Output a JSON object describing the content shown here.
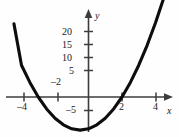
{
  "figure": {
    "kind": "cartesian-graph",
    "background_color": "#fefefe",
    "curve_color": "#0d0d0d",
    "axis_color": "#3c3c3c",
    "label_color": "#1a1a1a"
  },
  "chart_data": {
    "type": "line",
    "title": "",
    "subtitle": "",
    "xlabel": "x",
    "ylabel": "y",
    "grid": false,
    "legend": null,
    "xlim": [
      -4.7,
      5.3
    ],
    "ylim": [
      -9.5,
      24.5
    ],
    "x_ticks": [
      -4,
      -2,
      2,
      4
    ],
    "x_tick_labels": [
      "–4",
      "–2",
      "2",
      "4"
    ],
    "y_ticks": [
      -5,
      5,
      10,
      15,
      20
    ],
    "y_tick_labels": [
      "–5",
      "5",
      "10",
      "15",
      "20"
    ],
    "series": [
      {
        "name": "parabola",
        "equation": "y = x^2 + x - 6",
        "vertex": [
          -0.5,
          -6.25
        ],
        "roots": [
          -3.2,
          2.15
        ],
        "x": [
          -4.45,
          -4.0,
          -3.5,
          -3.0,
          -2.5,
          -2.0,
          -1.5,
          -1.0,
          -0.5,
          0.0,
          0.5,
          1.0,
          1.5,
          2.0,
          2.5,
          3.0,
          3.5,
          4.0,
          4.5,
          5.0
        ],
        "values": [
          13.8,
          6.0,
          2.75,
          0.0,
          -2.25,
          -4.0,
          -5.25,
          -6.0,
          -6.25,
          -6.0,
          -5.25,
          -4.0,
          -2.25,
          0.0,
          2.75,
          6.0,
          9.75,
          14.0,
          18.75,
          24.0
        ]
      }
    ]
  },
  "axis_labels": {
    "x_axis_name": "x",
    "y_axis_name": "y"
  }
}
